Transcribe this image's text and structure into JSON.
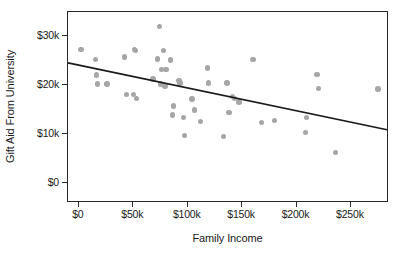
{
  "chart_data": {
    "type": "scatter",
    "title": "",
    "xlabel": "Family Income",
    "ylabel": "Gift Aid From University",
    "xlim": [
      -10000,
      285000
    ],
    "ylim": [
      -4000,
      35000
    ],
    "grid": false,
    "legend": null,
    "x_tick_labels": [
      "$0",
      "$50k",
      "$100k",
      "$150k",
      "$200k",
      "$250k"
    ],
    "x_tick_values": [
      0,
      50000,
      100000,
      150000,
      200000,
      250000
    ],
    "y_tick_labels": [
      "$0",
      "$10k",
      "$20k",
      "$30k"
    ],
    "y_tick_values": [
      0,
      10000,
      20000,
      30000
    ],
    "point_color": "#a6a6a6",
    "line_color": "#1a1a1a",
    "series": [
      {
        "name": "Students",
        "points": [
          [
            2000,
            27300
          ],
          [
            15000,
            25300
          ],
          [
            16000,
            22100
          ],
          [
            17000,
            20300
          ],
          [
            26000,
            20300
          ],
          [
            42000,
            25800
          ],
          [
            44000,
            18100
          ],
          [
            50000,
            18100
          ],
          [
            51000,
            27400
          ],
          [
            52000,
            27100
          ],
          [
            53000,
            17400
          ],
          [
            68000,
            21300
          ],
          [
            72000,
            25400
          ],
          [
            74000,
            32100
          ],
          [
            75000,
            20300
          ],
          [
            76000,
            23200
          ],
          [
            78000,
            27200
          ],
          [
            79000,
            19900
          ],
          [
            80000,
            23200
          ],
          [
            84000,
            25200
          ],
          [
            86000,
            14000
          ],
          [
            87000,
            15800
          ],
          [
            92000,
            21000
          ],
          [
            93000,
            20500
          ],
          [
            96000,
            13500
          ],
          [
            97000,
            9800
          ],
          [
            104000,
            17200
          ],
          [
            106000,
            15000
          ],
          [
            112000,
            12700
          ],
          [
            118000,
            23600
          ],
          [
            119000,
            20500
          ],
          [
            133000,
            9600
          ],
          [
            136000,
            20500
          ],
          [
            138000,
            14500
          ],
          [
            141000,
            17700
          ],
          [
            143000,
            17400
          ],
          [
            147000,
            16600
          ],
          [
            160000,
            25300
          ],
          [
            168000,
            12400
          ],
          [
            180000,
            12900
          ],
          [
            208000,
            10400
          ],
          [
            209000,
            13400
          ],
          [
            219000,
            22200
          ],
          [
            220000,
            19400
          ],
          [
            236000,
            6300
          ],
          [
            275000,
            19300
          ]
        ]
      }
    ],
    "trend_line": {
      "type": "linear-fit",
      "x_start": -10000,
      "y_start": 24500,
      "x_end": 285000,
      "y_end": 10700
    }
  }
}
